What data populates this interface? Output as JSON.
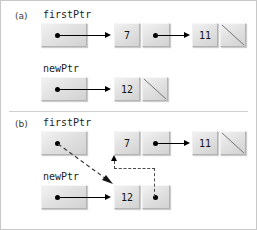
{
  "figure": {
    "colors": {
      "node_fill": "#e4e4e4",
      "node_border": "#b4b4b4",
      "line": "#000000",
      "dashed_line": "#4a4a4a",
      "frame": "#c8c8c8",
      "label_text": "#1d1d1d"
    }
  },
  "parts": [
    {
      "label": "(a)",
      "pointers": [
        {
          "name": "firstPtr",
          "label": "firstPtr"
        },
        {
          "name": "newPtr",
          "label": "newPtr"
        }
      ],
      "nodes": [
        {
          "value": "7",
          "next": "node-11",
          "null_cell": false
        },
        {
          "value": "11",
          "next": null,
          "null_cell": true
        },
        {
          "value": "12",
          "next": null,
          "null_cell": true
        }
      ]
    },
    {
      "label": "(b)",
      "pointers": [
        {
          "name": "firstPtr",
          "label": "firstPtr"
        },
        {
          "name": "newPtr",
          "label": "newPtr"
        }
      ],
      "nodes": [
        {
          "value": "7",
          "next": "node-11",
          "null_cell": false
        },
        {
          "value": "11",
          "next": null,
          "null_cell": true
        },
        {
          "value": "12",
          "next": "node-7",
          "null_cell": false
        }
      ]
    }
  ]
}
